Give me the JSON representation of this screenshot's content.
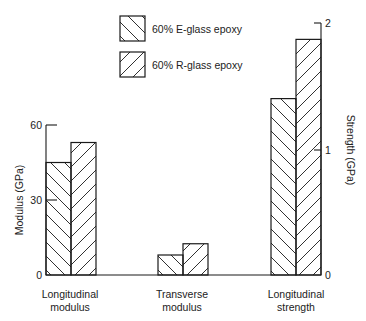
{
  "chart_data": {
    "type": "bar",
    "title": "",
    "categories": [
      "Longitudinal modulus",
      "Transverse modulus",
      "Longitudinal strength"
    ],
    "category_labels": [
      [
        "Longitudinal",
        "modulus"
      ],
      [
        "Transverse",
        "modulus"
      ],
      [
        "Longitudinal",
        "strength"
      ]
    ],
    "series": [
      {
        "name": "60% E-glass epoxy",
        "hatch": "backslash",
        "values": [
          45,
          8,
          1.4
        ]
      },
      {
        "name": "60% R-glass epoxy",
        "hatch": "slash",
        "values": [
          53,
          12.5,
          1.87
        ]
      }
    ],
    "axes": {
      "left": {
        "label": "Modulus (GPa)",
        "ticks": [
          0,
          30,
          60
        ],
        "range": [
          0,
          60
        ],
        "applies_to": [
          "Longitudinal modulus",
          "Transverse modulus"
        ]
      },
      "right": {
        "label": "Strength (GPa)",
        "ticks": [
          0,
          1,
          2
        ],
        "range": [
          0,
          2
        ],
        "applies_to": [
          "Longitudinal strength"
        ]
      }
    },
    "xlabel": "",
    "ylabel": "Modulus (GPa)",
    "y2label": "Strength (GPa)",
    "ylim": [
      0,
      60
    ],
    "y2lim": [
      0,
      2
    ],
    "grid": false,
    "legend_position": "top-center"
  },
  "legend": [
    {
      "label": "60% E-glass epoxy"
    },
    {
      "label": "60% R-glass epoxy"
    }
  ],
  "colors": {
    "ink": "#1a1a1a",
    "background": "#ffffff"
  }
}
